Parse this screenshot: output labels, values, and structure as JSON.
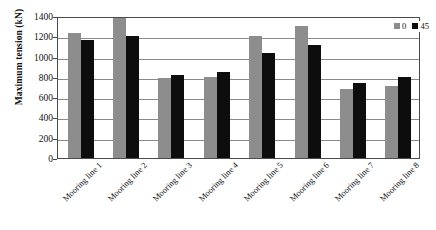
{
  "chart_data": {
    "type": "bar",
    "title": "",
    "xlabel": "",
    "ylabel": "Maximum tension (kN)",
    "ylim": [
      0,
      1400
    ],
    "yticks": [
      0,
      200,
      400,
      600,
      800,
      1000,
      1200,
      1400
    ],
    "ytick_labels": [
      "0",
      "200",
      "400",
      "600",
      "800",
      "1000",
      "1200",
      "1400"
    ],
    "grid": true,
    "legend_position": "top-right",
    "categories": [
      "Mooring line 1",
      "Mooring line 2",
      "Mooring line 3",
      "Mooring line 4",
      "Mooring line 5",
      "Mooring line 6",
      "Mooring line 7",
      "Mooring line 8"
    ],
    "series": [
      {
        "name": "0",
        "color": "#8d8d8d",
        "values": [
          1230,
          1400,
          790,
          800,
          1200,
          1300,
          680,
          710
        ]
      },
      {
        "name": "45",
        "color": "#0d0d0d",
        "values": [
          1160,
          1200,
          820,
          850,
          1040,
          1110,
          740,
          800
        ]
      }
    ]
  },
  "legend": {
    "entries": [
      {
        "label": "0"
      },
      {
        "label": "45"
      }
    ]
  }
}
